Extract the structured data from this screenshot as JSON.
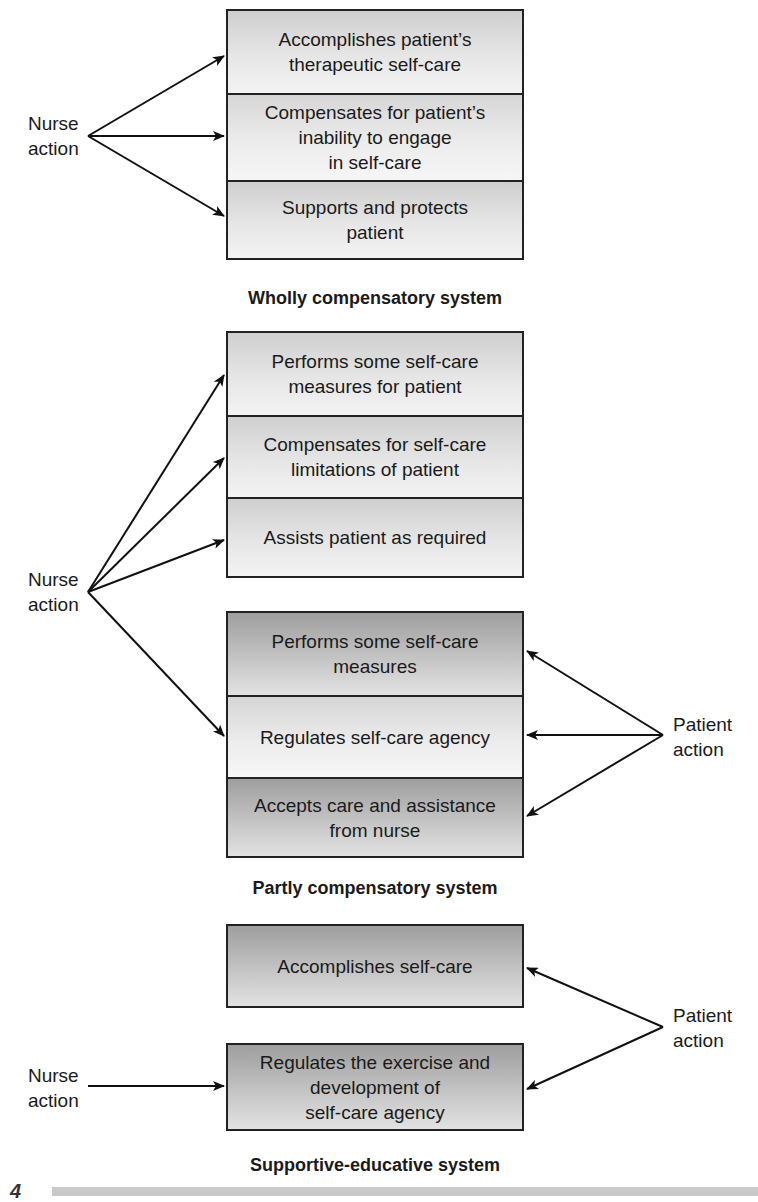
{
  "sections": [
    {
      "title": "Wholly compensatory system",
      "cells": [
        "Accomplishes patient’s\ntherapeutic self-care",
        "Compensates for patient’s\ninability to engage\nin self-care",
        "Supports and protects\npatient"
      ],
      "nurse_label": "Nurse\naction"
    },
    {
      "title": "Partly compensatory system",
      "nurse_cells": [
        "Performs some self-care\nmeasures for patient",
        "Compensates for self-care\nlimitations of patient",
        "Assists patient as required"
      ],
      "patient_cells": [
        "Performs some self-care\nmeasures",
        "Regulates self-care agency",
        "Accepts care and assistance\nfrom nurse"
      ],
      "nurse_label": "Nurse\naction",
      "patient_label": "Patient\naction"
    },
    {
      "title": "Supportive-educative system",
      "cells": [
        "Accomplishes self-care",
        "Regulates the exercise and\ndevelopment of\nself-care agency"
      ],
      "nurse_label": "Nurse\naction",
      "patient_label": "Patient\naction"
    }
  ],
  "figure_number_fragment": "4",
  "colors": {
    "stroke": "#222222",
    "light_fill_top": "#cfcfcf",
    "light_fill_bottom": "#f3f3f3",
    "dark_fill_top": "#9e9e9e",
    "dark_fill_bottom": "#e2e2e2"
  }
}
